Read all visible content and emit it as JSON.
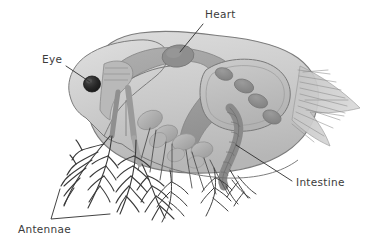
{
  "diagram": {
    "background_color": "#ffffff",
    "labels": [
      {
        "id": "heart",
        "text": "Heart",
        "text_x": 205,
        "text_y": 18,
        "leader": "M 203 24 L 180 52",
        "target_x": 178,
        "target_y": 54
      },
      {
        "id": "eye",
        "text": "Eye",
        "text_x": 42,
        "text_y": 63,
        "leader": "M 66 66 L 90 82",
        "target_x": 92,
        "target_y": 84
      },
      {
        "id": "intestine",
        "text": "Intestine",
        "text_x": 296,
        "text_y": 186,
        "leader": "M 292 181 L 236 145",
        "target_x": 235,
        "target_y": 144
      },
      {
        "id": "antennae",
        "text": "Antennae",
        "text_x": 18,
        "text_y": 233,
        "leader": "M 60 189 L 51 219 L 110 214",
        "target_x": 60,
        "target_y": 189
      }
    ],
    "structures": [
      {
        "id": "carapace",
        "name": "carapace-outer-shell",
        "color": "#c9c9c9"
      },
      {
        "id": "head",
        "name": "head-region",
        "color": "#cfcfcf"
      },
      {
        "id": "gut-band",
        "name": "gut-band",
        "color": "#9d9d9d"
      },
      {
        "id": "heart-organ",
        "name": "heart-organ",
        "color": "#8e8e8e"
      },
      {
        "id": "brood-chamber",
        "name": "brood-chamber",
        "color": "#bdbdbd"
      },
      {
        "id": "eggs",
        "name": "egg-cluster",
        "color": "#8b8b8b",
        "count": 4
      },
      {
        "id": "eye-spot",
        "name": "compound-eye",
        "color": "#2c2c2c"
      },
      {
        "id": "intestine-coil",
        "name": "intestine-coil",
        "color": "#9a9a9a"
      },
      {
        "id": "thoracic-legs",
        "name": "thoracic-legs",
        "color": "#ababab"
      },
      {
        "id": "antenna-left",
        "name": "antenna-branch-left",
        "color": "#3a3a3a"
      },
      {
        "id": "antenna-right",
        "name": "antenna-branch-right",
        "color": "#3a3a3a"
      },
      {
        "id": "tail-spines",
        "name": "tail-spines",
        "color": "#8a8a8a"
      }
    ],
    "palette": {
      "ink": "#2e2e2e",
      "label_ink": "#3b3b3b",
      "shell_light": "#d5d5d5",
      "shell_mid": "#c2c2c2",
      "shell_dark": "#9d9d9d",
      "organ_dark": "#8b8b8b",
      "eye_black": "#2c2c2c",
      "outline": "#6f6f6f"
    }
  }
}
